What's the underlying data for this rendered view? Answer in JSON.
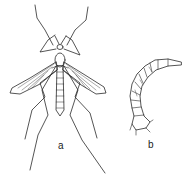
{
  "figure": {
    "panels": [
      {
        "id": "a",
        "label": "a",
        "subject": "adult crane fly (dorsal view, wings spread)"
      },
      {
        "id": "b",
        "label": "b",
        "subject": "larva (leatherjacket), curved segmented body"
      }
    ],
    "colors": {
      "ink": "#2a2a2a",
      "background": "#ffffff"
    }
  }
}
